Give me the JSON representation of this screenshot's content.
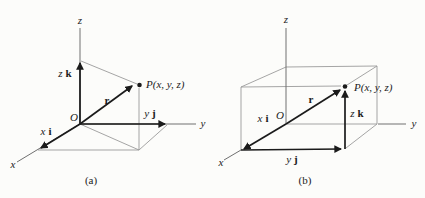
{
  "figure": {
    "background": "#fcfcfa",
    "colors": {
      "thin_line": "#9b9b9b",
      "axis_line": "#707070",
      "vector_line": "#1b1b1b",
      "text": "#1b1b1b"
    },
    "panels": [
      {
        "caption": "(a)",
        "origin_label": "O",
        "point_label": "P(x, y, z)",
        "position_vector_label": "r",
        "axis_labels": {
          "x": "x",
          "y": "y",
          "z": "z"
        },
        "components": {
          "x": {
            "scalar": "x",
            "unit": "i"
          },
          "y": {
            "scalar": "y",
            "unit": "j"
          },
          "z": {
            "scalar": "z",
            "unit": "k"
          }
        }
      },
      {
        "caption": "(b)",
        "origin_label": "O",
        "point_label": "P(x, y, z)",
        "position_vector_label": "r",
        "axis_labels": {
          "x": "x",
          "y": "y",
          "z": "z"
        },
        "components": {
          "x": {
            "scalar": "x",
            "unit": "i"
          },
          "y": {
            "scalar": "y",
            "unit": "j"
          },
          "z": {
            "scalar": "z",
            "unit": "k"
          }
        }
      }
    ]
  }
}
